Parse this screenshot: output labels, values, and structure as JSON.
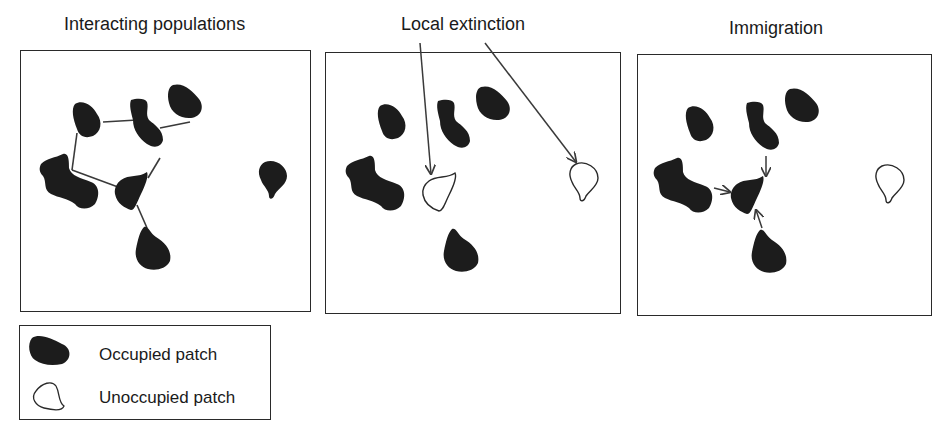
{
  "panels": [
    {
      "title": "Interacting populations"
    },
    {
      "title": "Local extinction"
    },
    {
      "title": "Immigration"
    }
  ],
  "legend": {
    "occupied": "Occupied patch",
    "unoccupied": "Unoccupied patch"
  },
  "colors": {
    "patch_fill": "#1c1c1c",
    "line": "#3a3a3a",
    "background": "#ffffff"
  }
}
